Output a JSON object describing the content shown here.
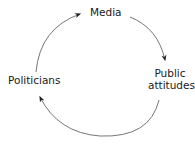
{
  "diagram": {
    "type": "cycle",
    "nodes": [
      {
        "id": "media",
        "label": "Media"
      },
      {
        "id": "public_attitudes",
        "label_line1": "Public",
        "label_line2": "attitudes"
      },
      {
        "id": "politicians",
        "label": "Politicians"
      }
    ],
    "edges": [
      {
        "from": "media",
        "to": "public_attitudes"
      },
      {
        "from": "public_attitudes",
        "to": "politicians"
      },
      {
        "from": "politicians",
        "to": "media"
      }
    ],
    "colors": {
      "arrow": "#555555",
      "arrowhead": "#222222",
      "text": "#1a1a1a"
    }
  }
}
